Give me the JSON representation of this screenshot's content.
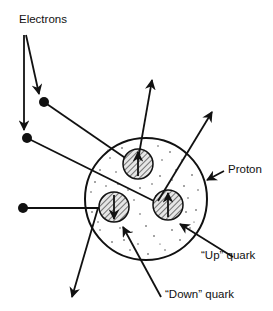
{
  "diagram": {
    "type": "physics-illustration",
    "labels": {
      "electrons": "Electrons",
      "proton": "Proton",
      "up_quark": "“Up” quark",
      "down_quark": "“Down” quark"
    },
    "colors": {
      "ink": "#111111",
      "background": "#ffffff",
      "proton_fill": "#ffffff",
      "quark_fill": "#dddddd"
    },
    "proton": {
      "cx": 146,
      "cy": 199,
      "r": 61
    },
    "quarks": [
      {
        "name": "up-quark-top",
        "flavor": "up",
        "cx": 138,
        "cy": 164,
        "r": 15,
        "spin": "up"
      },
      {
        "name": "down-quark-left",
        "flavor": "down",
        "cx": 114,
        "cy": 207,
        "r": 15,
        "spin": "down"
      },
      {
        "name": "up-quark-right",
        "flavor": "up",
        "cx": 168,
        "cy": 205,
        "r": 15,
        "spin": "up"
      }
    ],
    "electrons": [
      {
        "name": "electron-1",
        "x": 44,
        "y": 102,
        "target": "up-quark-top"
      },
      {
        "name": "electron-2",
        "x": 27,
        "y": 138,
        "target": "up-quark-right"
      },
      {
        "name": "electron-3",
        "x": 23,
        "y": 208,
        "target": "down-quark-left"
      }
    ]
  }
}
